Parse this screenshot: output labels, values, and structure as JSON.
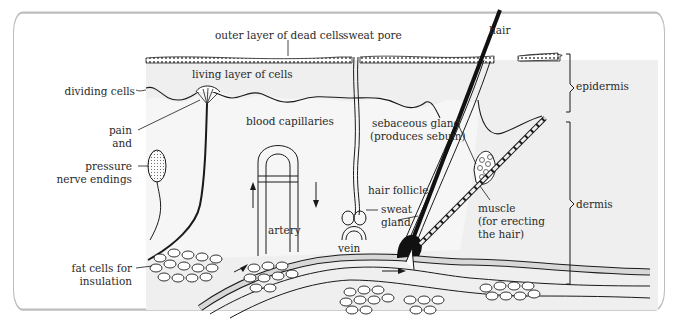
{
  "figure": {
    "colors": {
      "border": "#bdbdbd",
      "skin_fill": "#ececec",
      "line": "#1a1a1a",
      "text": "#2a2a2a",
      "background": "#ffffff"
    },
    "labels": {
      "outer_layer": "outer layer of dead cells",
      "sweat_pore": "sweat pore",
      "hair": "hair",
      "living_layer": "living layer of cells",
      "dividing_cells": "dividing cells",
      "pain_1": "pain",
      "pain_2": "and",
      "pressure_1": "pressure",
      "pressure_2": "nerve endings",
      "blood_capillaries": "blood capillaries",
      "sebaceous_1": "sebaceous gland",
      "sebaceous_2": "(produces sebum)",
      "hair_follicle": "hair follicle",
      "sweat_gland_1": "sweat",
      "sweat_gland_2": "gland",
      "muscle_1": "muscle",
      "muscle_2": "(for erecting",
      "muscle_3": "the hair)",
      "artery": "artery",
      "vein": "vein",
      "fat_1": "fat cells for",
      "fat_2": "insulation",
      "epidermis": "epidermis",
      "dermis": "dermis"
    }
  }
}
